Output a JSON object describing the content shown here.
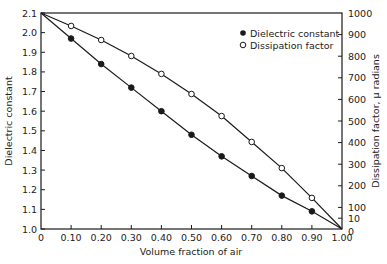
{
  "chart_data": {
    "type": "line",
    "title": "",
    "xlabel": "Volume fraction of air",
    "ylabel": "Dielectric constant",
    "ylabel_right": "Dissipation factor, μ radians",
    "xlim": [
      0,
      1.0
    ],
    "ylim": [
      1.0,
      2.1
    ],
    "ylim_right": [
      0,
      1000
    ],
    "grid": false,
    "legend_position": "upper right",
    "x_tick_labels": [
      "0",
      "0.10",
      "0.20",
      "0.30",
      "0.40",
      "0.50",
      "0.60",
      "0.70",
      "0.80",
      "0.90",
      "1.00"
    ],
    "y_tick_labels": [
      "1.0",
      "1.1",
      "1.2",
      "1.3",
      "1.4",
      "1.5",
      "1.6",
      "1.7",
      "1.8",
      "1.9",
      "2.0",
      "2.1"
    ],
    "y_right_tick_labels": [
      "0",
      "10",
      "100",
      "200",
      "300",
      "400",
      "500",
      "600",
      "700",
      "800",
      "900",
      "1000"
    ],
    "x": [
      0,
      0.1,
      0.2,
      0.3,
      0.4,
      0.5,
      0.6,
      0.7,
      0.8,
      0.9,
      1.0
    ],
    "series": [
      {
        "name": "Dielectric constant",
        "marker": "filled-circle",
        "axis": "left",
        "values": [
          2.1,
          1.97,
          1.84,
          1.72,
          1.6,
          1.48,
          1.37,
          1.27,
          1.17,
          1.09,
          1.0
        ]
      },
      {
        "name": "Dissipation factor",
        "marker": "open-circle",
        "axis": "right",
        "values": [
          1000,
          940,
          875,
          801,
          718,
          625,
          523,
          403,
          282,
          144,
          0
        ]
      }
    ]
  },
  "legend": {
    "items": [
      {
        "label": "Dielectric constant",
        "marker": "filled-circle"
      },
      {
        "label": "Dissipation factor",
        "marker": "open-circle"
      }
    ]
  },
  "colors": {
    "line": "#1a1a1a",
    "background": "#ffffff"
  }
}
